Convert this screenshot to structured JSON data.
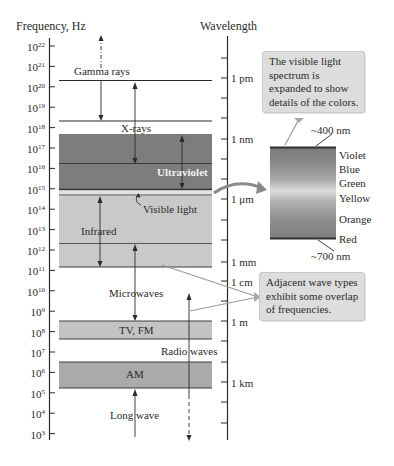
{
  "axes": {
    "frequency_title": "Frequency, Hz",
    "wavelength_title": "Wavelength",
    "frequency_ticks": [
      {
        "base": "10",
        "exp": "22"
      },
      {
        "base": "10",
        "exp": "21"
      },
      {
        "base": "10",
        "exp": "20"
      },
      {
        "base": "10",
        "exp": "19"
      },
      {
        "base": "10",
        "exp": "18"
      },
      {
        "base": "10",
        "exp": "17"
      },
      {
        "base": "10",
        "exp": "16"
      },
      {
        "base": "10",
        "exp": "15"
      },
      {
        "base": "10",
        "exp": "14"
      },
      {
        "base": "10",
        "exp": "13"
      },
      {
        "base": "10",
        "exp": "12"
      },
      {
        "base": "10",
        "exp": "11"
      },
      {
        "base": "10",
        "exp": "10"
      },
      {
        "base": "10",
        "exp": "9"
      },
      {
        "base": "10",
        "exp": "8"
      },
      {
        "base": "10",
        "exp": "7"
      },
      {
        "base": "10",
        "exp": "6"
      },
      {
        "base": "10",
        "exp": "5"
      },
      {
        "base": "10",
        "exp": "4"
      },
      {
        "base": "10",
        "exp": "3"
      }
    ],
    "wavelength_labels": [
      "1 pm",
      "1 nm",
      "1 μm",
      "1 mm",
      "1 cm",
      "1 m",
      "1 km"
    ]
  },
  "bands": {
    "gamma": "Gamma rays",
    "xray": "X-rays",
    "ultraviolet": "Ultraviolet",
    "visible": "Visible light",
    "infrared": "Infrared",
    "microwaves": "Microwaves",
    "tvfm": "TV, FM",
    "radio": "Radio waves",
    "am": "AM",
    "longwave": "Long wave"
  },
  "visible_spectrum": {
    "top_label": "~400 nm",
    "bottom_label": "~700 nm",
    "colors": [
      "Violet",
      "Blue",
      "Green",
      "Yellow",
      "Orange",
      "Red"
    ]
  },
  "callouts": {
    "visible": [
      "The visible light",
      "spectrum is",
      "expanded to show",
      "details of the colors."
    ],
    "overlap": [
      "Adjacent wave types",
      "exhibit some overlap",
      "of frequencies."
    ]
  },
  "colors": {
    "dark_band": "#7d7d7d",
    "light_band": "#c9c9c9",
    "mid_band": "#bdbdbd",
    "am_band": "#a9a9a9",
    "callout_bg": "#dddddd",
    "line": "#3a3a3a"
  }
}
